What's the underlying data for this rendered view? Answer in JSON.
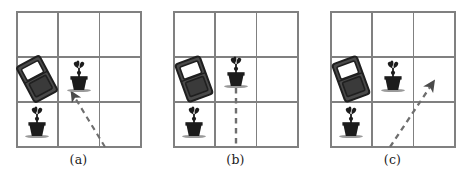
{
  "figure": {
    "type": "multi-panel-grid-diagram",
    "background_color": "#ffffff",
    "grid_line_color": "#808080",
    "object_color": "#262626",
    "dash_color": "#6e6e6e",
    "panels": [
      {
        "id": "panel-a",
        "caption": "(a)",
        "grid": {
          "rows": 3,
          "cols": 3
        },
        "objects": [
          {
            "name": "brick",
            "label": "brick",
            "row": 2,
            "col": 1,
            "rotation_deg": -28
          },
          {
            "name": "plant",
            "label": "potted-plant",
            "row": 2,
            "col": 2
          },
          {
            "name": "plant",
            "label": "potted-plant",
            "row": 3,
            "col": 1
          }
        ],
        "path": {
          "name": "dashed-arrow",
          "has_arrowhead": true,
          "arrow_at": "end",
          "points": [
            [
              89,
              137
            ],
            [
              53,
              79
            ]
          ],
          "description": "dashed arrow from bottom edge of center-bottom cell up-left to the brick"
        }
      },
      {
        "id": "panel-b",
        "caption": "(b)",
        "grid": {
          "rows": 3,
          "cols": 3
        },
        "objects": [
          {
            "name": "brick",
            "label": "brick",
            "row": 2,
            "col": 1,
            "rotation_deg": -20
          },
          {
            "name": "plant",
            "label": "potted-plant",
            "row": 2,
            "col": 2
          },
          {
            "name": "plant",
            "label": "potted-plant",
            "row": 3,
            "col": 1
          }
        ],
        "path": {
          "name": "dashed-line",
          "has_arrowhead": false,
          "arrow_at": "none",
          "points": [
            [
              63,
              66
            ],
            [
              63,
              137
            ]
          ],
          "description": "vertical dashed line from center plant straight down to bottom grid edge"
        }
      },
      {
        "id": "panel-c",
        "caption": "(c)",
        "grid": {
          "rows": 3,
          "cols": 3
        },
        "objects": [
          {
            "name": "brick",
            "label": "brick",
            "row": 2,
            "col": 1,
            "rotation_deg": -20
          },
          {
            "name": "plant",
            "label": "potted-plant",
            "row": 2,
            "col": 2
          },
          {
            "name": "plant",
            "label": "potted-plant",
            "row": 3,
            "col": 1
          }
        ],
        "path": {
          "name": "dashed-arrow",
          "has_arrowhead": true,
          "arrow_at": "end",
          "points": [
            [
              60,
              137
            ],
            [
              106,
              68
            ]
          ],
          "description": "dashed arrow from bottom of center-bottom cell up-right into right-middle cell"
        }
      }
    ]
  }
}
